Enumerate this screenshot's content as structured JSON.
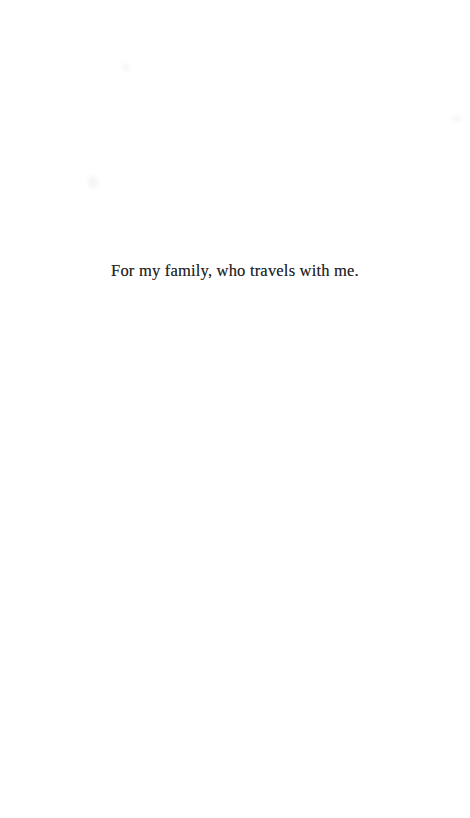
{
  "page": {
    "dedication": "For my family, who travels with me."
  }
}
